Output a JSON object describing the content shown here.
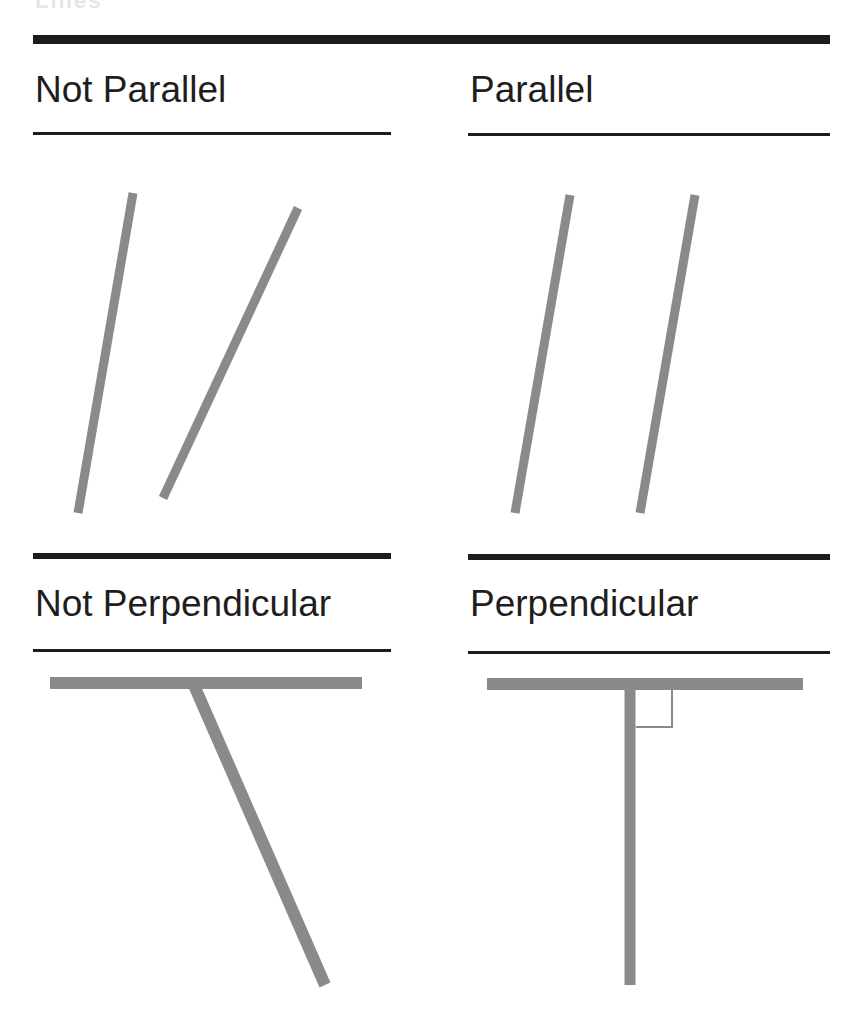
{
  "title_cutoff": "Lines",
  "panels": [
    {
      "label": "Not Parallel",
      "relation": "not-parallel"
    },
    {
      "label": "Parallel",
      "relation": "parallel"
    },
    {
      "label": "Not Perpendicular",
      "relation": "not-perpendicular"
    },
    {
      "label": "Perpendicular",
      "relation": "perpendicular"
    }
  ],
  "colors": {
    "rule": "#1c1c1c",
    "line": "#8a8a8a",
    "text": "#1e1e1e",
    "background": "#ffffff"
  },
  "geometry": {
    "not_parallel": [
      {
        "x1": 133,
        "y1": 193,
        "x2": 78,
        "y2": 513
      },
      {
        "x1": 298,
        "y1": 208,
        "x2": 163,
        "y2": 498
      }
    ],
    "parallel": [
      {
        "x1": 570,
        "y1": 195,
        "x2": 515,
        "y2": 513
      },
      {
        "x1": 695,
        "y1": 195,
        "x2": 640,
        "y2": 513
      }
    ],
    "not_perpendicular": [
      {
        "x1": 50,
        "y1": 683,
        "x2": 362,
        "y2": 683
      },
      {
        "x1": 193,
        "y1": 683,
        "x2": 325,
        "y2": 985
      }
    ],
    "perpendicular": [
      {
        "x1": 487,
        "y1": 684,
        "x2": 803,
        "y2": 684
      },
      {
        "x1": 630,
        "y1": 684,
        "x2": 630,
        "y2": 985
      }
    ],
    "right_angle_marker": {
      "x": 636,
      "y": 690,
      "w": 36,
      "h": 37
    }
  }
}
